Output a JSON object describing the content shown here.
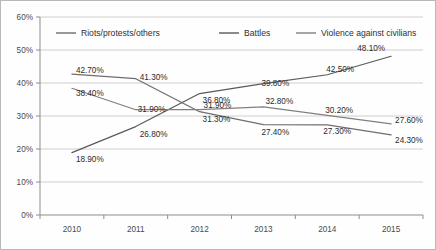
{
  "chart_data": {
    "type": "line",
    "title": "",
    "xlabel": "",
    "ylabel": "",
    "categories": [
      "2010",
      "2011",
      "2012",
      "2013",
      "2014",
      "2015"
    ],
    "x": [
      2010,
      2011,
      2012,
      2013,
      2014,
      2015
    ],
    "ylim": [
      0,
      60
    ],
    "yticks": [
      0,
      10,
      20,
      30,
      40,
      50,
      60
    ],
    "ytick_labels": [
      "0%",
      "10%",
      "20%",
      "30%",
      "40%",
      "50%",
      "60%"
    ],
    "grid": true,
    "legend_position": "top-inside",
    "value_labels_shown": true,
    "series": [
      {
        "name": "Riots/protests/others",
        "color": "#6e6e6e",
        "values": [
          42.7,
          41.3,
          31.3,
          27.4,
          27.3,
          24.3
        ],
        "labels": [
          "42.70%",
          "41.30%",
          "31.30%",
          "27.40%",
          "27.30%",
          "24.30%"
        ]
      },
      {
        "name": "Battles",
        "color": "#5a5a5a",
        "values": [
          18.9,
          26.8,
          36.8,
          39.8,
          42.5,
          48.1
        ],
        "labels": [
          "18.90%",
          "26.80%",
          "36.80%",
          "39.80%",
          "42.50%",
          "48.10%"
        ]
      },
      {
        "name": "Violence against civilians",
        "color": "#808080",
        "values": [
          38.4,
          31.9,
          31.9,
          32.8,
          30.2,
          27.6
        ],
        "labels": [
          "38.40%",
          "31.90%",
          "31.90%",
          "32.80%",
          "30.20%",
          "27.60%"
        ]
      }
    ]
  },
  "legend": {
    "items": [
      {
        "label": "Riots/protests/others"
      },
      {
        "label": "Battles"
      },
      {
        "label": "Violence against civilians"
      }
    ]
  },
  "axes": {
    "y_labels": [
      "60%",
      "50%",
      "40%",
      "30%",
      "20%",
      "10%",
      "0%"
    ],
    "x_labels": [
      "2010",
      "2011",
      "2012",
      "2013",
      "2014",
      "2015"
    ]
  }
}
